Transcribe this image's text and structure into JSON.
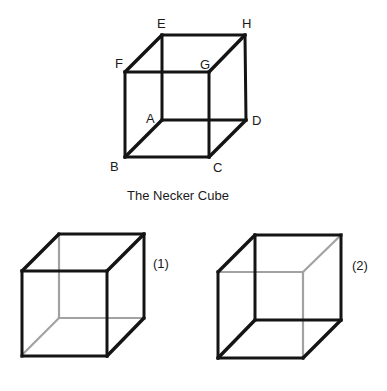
{
  "figure": {
    "caption": "The Necker Cube",
    "colors": {
      "visible_edge": "#141414",
      "hidden_edge": "#a2a2a2",
      "background": "#ffffff"
    },
    "main_cube": {
      "vertex_labels": {
        "A": "A",
        "B": "B",
        "C": "C",
        "D": "D",
        "E": "E",
        "F": "F",
        "G": "G",
        "H": "H"
      },
      "vertices": {
        "A": [
          162,
          120
        ],
        "B": [
          125,
          157
        ],
        "C": [
          210,
          157
        ],
        "D": [
          247,
          120
        ],
        "E": [
          162,
          35
        ],
        "F": [
          125,
          72
        ],
        "G": [
          209,
          72
        ],
        "H": [
          245,
          35
        ]
      }
    },
    "variants": [
      {
        "label": "(1)",
        "description": "Face ABFE... interpreted as back: hidden edges meet at lower-left-back vertex",
        "hidden_edges": [
          "E-A",
          "A-D",
          "A-B"
        ]
      },
      {
        "label": "(2)",
        "description": "Hidden edges meet at upper-right-front vertex",
        "hidden_edges": [
          "F-G",
          "G-H",
          "G-C"
        ]
      }
    ]
  }
}
